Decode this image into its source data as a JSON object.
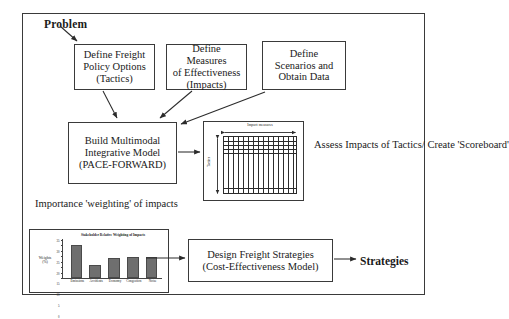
{
  "diagram": {
    "entry_label": "Problem",
    "exit_label": "Strategies",
    "boxes": {
      "tactics": "Define Freight\nPolicy Options\n(Tactics)",
      "tactics_lines": [
        "Define Freight",
        "Policy Options",
        "(Tactics)"
      ],
      "moe_lines": [
        "Define Measures",
        "of Effectiveness",
        "(Impacts)"
      ],
      "scenarios_lines": [
        "Define",
        "Scenarios and",
        "Obtain Data"
      ],
      "model_lines": [
        "Build Multimodal",
        "Integrative Model",
        "(PACE-FORWARD)"
      ],
      "design_lines": [
        "Design Freight Strategies",
        "(Cost-Effectiveness Model)"
      ]
    },
    "annotations": {
      "assess_lines": [
        "Assess Impacts",
        "of Tactics/",
        "Create 'Scoreboard'"
      ],
      "importance_lines": [
        "Importance 'weighting'",
        "of impacts"
      ]
    },
    "scoreboard": {
      "top_axis_label": "Impact measures",
      "side_axis_label": "Tactics"
    },
    "colors": {
      "line": "#3a3a3a",
      "bar_fill": "#6f6f6f",
      "text": "#1a1a1a"
    }
  },
  "chart_data": {
    "type": "bar",
    "title": "Stakeholder Relative Weighting of Impacts",
    "xlabel": "",
    "ylabel": "Weights (%)",
    "ylabel_lines": [
      "Weights",
      "(%)"
    ],
    "categories": [
      "Emissions",
      "Accidents",
      "Economy",
      "Congestion",
      "Noise"
    ],
    "values": [
      30,
      12,
      18,
      19,
      19
    ],
    "ylim": [
      0,
      35
    ],
    "yticks": [
      0,
      5,
      10,
      15,
      20,
      25,
      30,
      35
    ],
    "ytick_labels": [
      "0",
      "5",
      "10",
      "15",
      "20",
      "25",
      "30",
      "35"
    ],
    "grid": false,
    "legend": "none"
  }
}
